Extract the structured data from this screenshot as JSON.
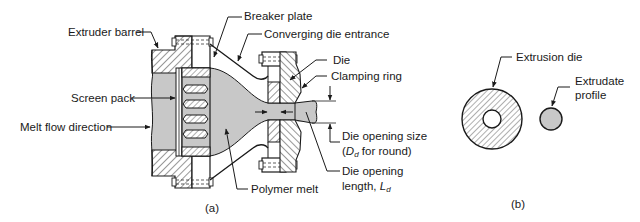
{
  "figure_a": {
    "caption": "(a)",
    "labels": {
      "extruder_barrel": "Extruder barrel",
      "breaker_plate": "Breaker plate",
      "converging_die_entrance": "Converging die entrance",
      "die": "Die",
      "clamping_ring": "Clamping ring",
      "screen_pack": "Screen pack",
      "melt_flow_direction": "Melt flow direction",
      "die_opening_size_1": "Die opening size",
      "die_opening_size_2a": "(",
      "die_opening_size_2b": "D",
      "die_opening_size_2c": "d",
      "die_opening_size_2d": " for round)",
      "die_opening_length_1": "Die opening",
      "die_opening_length_2a": "length, ",
      "die_opening_length_2b": "L",
      "die_opening_length_2c": "d",
      "polymer_melt": "Polymer melt"
    }
  },
  "figure_b": {
    "caption": "(b)",
    "labels": {
      "extrusion_die": "Extrusion die",
      "extrudate_1": "Extrudate",
      "extrudate_2": "profile"
    }
  },
  "colors": {
    "melt_fill": "#c8c8c8",
    "line": "#1a1a1a",
    "background": "#ffffff"
  }
}
